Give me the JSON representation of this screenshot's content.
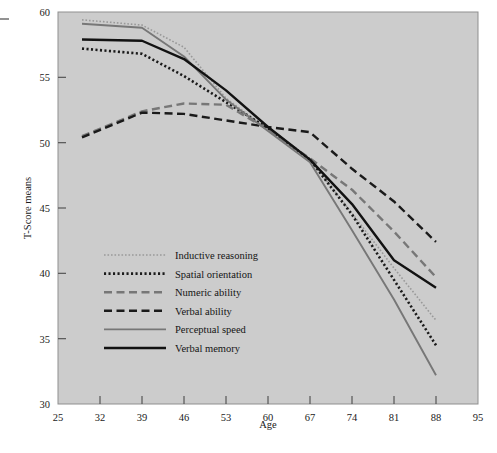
{
  "figure": {
    "background": "#ffffff",
    "plot_background": "#cccccc",
    "plot_border": "#8a8a8a"
  },
  "chart_data": {
    "type": "line",
    "title": "",
    "xlabel": "Age",
    "ylabel": "T-Score means",
    "xlim": [
      25,
      95
    ],
    "ylim": [
      30,
      60
    ],
    "xticks": [
      25,
      32,
      39,
      46,
      53,
      60,
      67,
      74,
      81,
      88,
      95
    ],
    "yticks": [
      30,
      35,
      40,
      45,
      50,
      55,
      60
    ],
    "grid": false,
    "legend_position": "lower left inside plot",
    "x": [
      29,
      39,
      46,
      53,
      60,
      67,
      74,
      81,
      88
    ],
    "series": [
      {
        "name": "Inductive reasoning",
        "style": "dotted-fine",
        "color": "#999999",
        "values": [
          59.4,
          59.0,
          57.3,
          53.4,
          51.0,
          48.7,
          44.6,
          40.4,
          36.4
        ]
      },
      {
        "name": "Spatial orientation",
        "style": "dotted-bold",
        "color": "#1a1a1a",
        "values": [
          57.2,
          56.8,
          55.1,
          53.1,
          51.1,
          48.7,
          44.5,
          39.5,
          34.5
        ]
      },
      {
        "name": "Numeric ability",
        "style": "dashed",
        "color": "#777777",
        "values": [
          50.5,
          52.4,
          53.0,
          52.9,
          51.0,
          48.8,
          46.4,
          43.2,
          39.7
        ]
      },
      {
        "name": "Verbal ability",
        "style": "dashed",
        "color": "#1a1a1a",
        "values": [
          50.4,
          52.3,
          52.2,
          51.7,
          51.2,
          50.8,
          48.0,
          45.5,
          42.4
        ]
      },
      {
        "name": "Perceptual speed",
        "style": "solid",
        "color": "#777777",
        "values": [
          59.1,
          58.8,
          56.6,
          53.3,
          50.9,
          48.5,
          43.3,
          38.0,
          32.2
        ]
      },
      {
        "name": "Verbal memory",
        "style": "solid",
        "color": "#121212",
        "values": [
          57.9,
          57.8,
          56.4,
          54.0,
          51.2,
          48.7,
          45.3,
          41.0,
          38.9
        ]
      }
    ]
  },
  "axes": {
    "y_title": "T-Score means",
    "x_title": "Age",
    "x_tick_labels": [
      "25",
      "32",
      "39",
      "46",
      "53",
      "60",
      "67",
      "74",
      "81",
      "88",
      "95"
    ],
    "y_tick_labels": [
      "30",
      "35",
      "40",
      "45",
      "50",
      "55",
      "60"
    ]
  },
  "legend": {
    "items": [
      {
        "label": "Inductive reasoning",
        "style": "dotted-fine",
        "color": "#999999"
      },
      {
        "label": "Spatial orientation",
        "style": "dotted-bold",
        "color": "#1a1a1a"
      },
      {
        "label": "Numeric ability",
        "style": "dashed",
        "color": "#777777"
      },
      {
        "label": "Verbal ability",
        "style": "dashed",
        "color": "#1a1a1a"
      },
      {
        "label": "Perceptual speed",
        "style": "solid",
        "color": "#777777"
      },
      {
        "label": "Verbal memory",
        "style": "solid",
        "color": "#121212"
      }
    ]
  },
  "left_tick_mark": {
    "present": true
  }
}
